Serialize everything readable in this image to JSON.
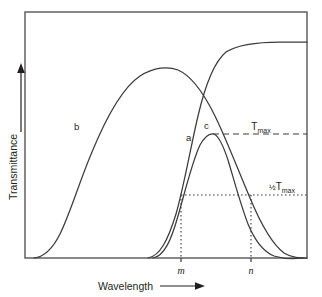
{
  "figure": {
    "kind": "transmittance-vs-wavelength-diagram",
    "axes": {
      "x_title": "Wavelength",
      "x_arrow": "right-arrow",
      "y_title": "Transmittance",
      "y_arrow": "up-arrow",
      "x_ticks": [
        "m",
        "n"
      ],
      "frame": {
        "left": 25,
        "top": 12,
        "right": 307,
        "bottom": 258
      }
    },
    "curve_labels": {
      "a": "a",
      "b": "b",
      "c": "c"
    },
    "levels": {
      "tmax_label": "T",
      "tmax_sub": "max",
      "halfmax_frac": "½",
      "halfmax_label": "T",
      "halfmax_sub": "max"
    }
  },
  "chart_data": {
    "type": "line",
    "title": "",
    "xlabel": "Wavelength",
    "ylabel": "Transmittance",
    "xlim": [
      25,
      307
    ],
    "ylim": [
      258,
      12
    ],
    "grid": false,
    "legend": "inline-curve-labels",
    "annotations": [
      {
        "name": "tmax-line",
        "style": "dashed",
        "y": 134,
        "x_from": 213,
        "x_to": 307,
        "label": "T max"
      },
      {
        "name": "halfmax-line",
        "style": "dotted",
        "y": 195,
        "x_from": 181,
        "x_to": 307,
        "label": "1/2 T max"
      },
      {
        "name": "dropline-m",
        "style": "dotted",
        "x": 181,
        "y_from": 195,
        "y_to": 258,
        "label": "m"
      },
      {
        "name": "dropline-n",
        "style": "dotted",
        "x": 251,
        "y_from": 195,
        "y_to": 258,
        "label": "n"
      }
    ],
    "series": [
      {
        "name": "a",
        "description": "sigmoidal rising transmittance curve reaching plateau",
        "label_x": 186,
        "label_y": 141,
        "path": "M 148,258 C 160,256 168,240 176,214 C 184,186 190,150 198,116 C 205,86 214,62 226,52 C 240,43 262,42 280,42 C 292,42 300,42 307,42"
      },
      {
        "name": "b",
        "description": "broad band-pass curve peaking mid-range",
        "label_x": 74,
        "label_y": 130,
        "path": "M 34,258 C 44,257 52,250 60,234 C 70,214 80,180 92,152 C 106,118 122,88 140,76 C 154,67 168,66 178,70 C 192,76 203,92 214,114 C 226,138 238,170 250,198 C 260,222 272,244 284,253 C 292,258 300,258 307,258"
      },
      {
        "name": "c",
        "description": "narrow band-pass curve peaking at T max",
        "label_x": 204,
        "label_y": 129,
        "path": "M 153,258 C 164,256 171,241 178,216 C 185,192 192,162 200,145 C 205,136 210,133 214,134 C 219,136 223,145 228,160 C 234,180 241,206 248,224 C 255,241 264,252 274,256 C 284,259 296,259 303,258"
      }
    ]
  }
}
